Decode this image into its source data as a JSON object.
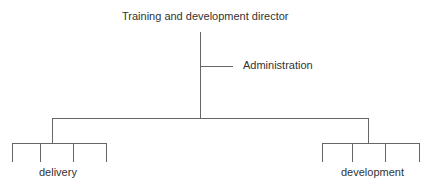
{
  "chart": {
    "title": "Training and development director",
    "nodes": {
      "admin": "Administration",
      "left": "delivery",
      "right": "development"
    },
    "line_color": "#666666"
  }
}
